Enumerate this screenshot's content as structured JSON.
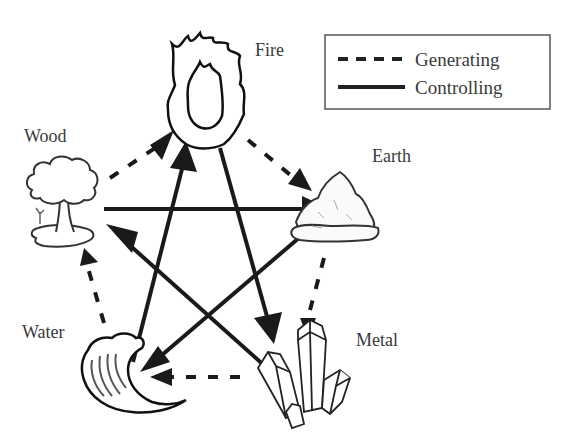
{
  "diagram": {
    "type": "wu-xing-five-elements-cycle",
    "legend": {
      "items": [
        {
          "style": "dashed",
          "label": "Generating"
        },
        {
          "style": "solid",
          "label": "Controlling"
        }
      ]
    },
    "elements": [
      {
        "id": "fire",
        "label": "Fire",
        "icon": "flame-icon"
      },
      {
        "id": "earth",
        "label": "Earth",
        "icon": "rock-icon"
      },
      {
        "id": "metal",
        "label": "Metal",
        "icon": "crystals-icon"
      },
      {
        "id": "water",
        "label": "Water",
        "icon": "wave-icon"
      },
      {
        "id": "wood",
        "label": "Wood",
        "icon": "tree-icon"
      }
    ],
    "generating_cycle": [
      {
        "from": "Wood",
        "to": "Fire"
      },
      {
        "from": "Fire",
        "to": "Earth"
      },
      {
        "from": "Earth",
        "to": "Metal"
      },
      {
        "from": "Metal",
        "to": "Water"
      },
      {
        "from": "Water",
        "to": "Wood"
      }
    ],
    "controlling_cycle": [
      {
        "from": "Wood",
        "to": "Earth"
      },
      {
        "from": "Earth",
        "to": "Water"
      },
      {
        "from": "Water",
        "to": "Fire"
      },
      {
        "from": "Fire",
        "to": "Metal"
      },
      {
        "from": "Metal",
        "to": "Wood"
      }
    ]
  }
}
